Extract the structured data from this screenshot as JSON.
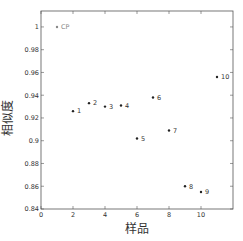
{
  "chart_data": {
    "type": "scatter",
    "title": "",
    "xlabel": "样品",
    "ylabel": "相似度",
    "xlim": [
      0,
      12
    ],
    "ylim": [
      0.84,
      1.014
    ],
    "xticks": [
      0,
      2,
      4,
      6,
      8,
      10
    ],
    "yticks": [
      0.84,
      0.86,
      0.88,
      0.9,
      0.92,
      0.94,
      0.96,
      0.98,
      1
    ],
    "ytick_labels": [
      "0.84",
      "0.86",
      "0.88",
      "0.9",
      "0.92",
      "0.94",
      "0.96",
      "0.98",
      "1"
    ],
    "grid": false,
    "legend": null,
    "points": [
      {
        "label": "CP",
        "x": 1,
        "y": 1.0
      },
      {
        "label": "1",
        "x": 2,
        "y": 0.926
      },
      {
        "label": "2",
        "x": 3,
        "y": 0.933
      },
      {
        "label": "3",
        "x": 4,
        "y": 0.93
      },
      {
        "label": "4",
        "x": 5,
        "y": 0.931
      },
      {
        "label": "5",
        "x": 6,
        "y": 0.902
      },
      {
        "label": "6",
        "x": 7,
        "y": 0.938
      },
      {
        "label": "7",
        "x": 8,
        "y": 0.909
      },
      {
        "label": "8",
        "x": 9,
        "y": 0.86
      },
      {
        "label": "9",
        "x": 10,
        "y": 0.855
      },
      {
        "label": "10",
        "x": 11,
        "y": 0.956
      }
    ],
    "colors": {
      "frame": "#555555",
      "point": "#222222",
      "cp_point": "#888888",
      "text": "#333333"
    }
  }
}
